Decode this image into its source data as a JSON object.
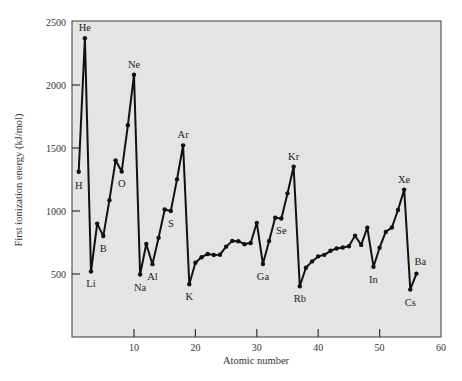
{
  "chart_data": {
    "type": "line",
    "title": "",
    "xlabel": "Atomic number",
    "ylabel": "First ionization energy (kJ/mol)",
    "xlim": [
      0,
      60
    ],
    "ylim": [
      0,
      2500
    ],
    "grid": false,
    "legend": null,
    "x_ticks": [
      10,
      20,
      30,
      40,
      50,
      60
    ],
    "y_ticks": [
      500,
      1000,
      1500,
      2000,
      2500
    ],
    "colors": {
      "plot_background": "#e4e4e4",
      "line": "#111111",
      "frame": "#555555"
    },
    "x": [
      1,
      2,
      3,
      4,
      5,
      6,
      7,
      8,
      9,
      10,
      11,
      12,
      13,
      14,
      15,
      16,
      17,
      18,
      19,
      20,
      21,
      22,
      23,
      24,
      25,
      26,
      27,
      28,
      29,
      30,
      31,
      32,
      33,
      34,
      35,
      36,
      37,
      38,
      39,
      40,
      41,
      42,
      43,
      44,
      45,
      46,
      47,
      48,
      49,
      50,
      51,
      52,
      53,
      54,
      55,
      56
    ],
    "series": [
      {
        "name": "First ionization energy",
        "values": [
          1312,
          2372,
          520,
          900,
          801,
          1086,
          1402,
          1314,
          1681,
          2081,
          496,
          738,
          578,
          787,
          1012,
          1000,
          1251,
          1521,
          419,
          590,
          633,
          659,
          651,
          653,
          717,
          763,
          760,
          737,
          746,
          906,
          579,
          762,
          947,
          941,
          1140,
          1351,
          403,
          550,
          600,
          640,
          652,
          684,
          702,
          710,
          720,
          804,
          731,
          868,
          558,
          709,
          834,
          869,
          1008,
          1170,
          376,
          503
        ]
      }
    ],
    "annotations": [
      {
        "x": 1,
        "label": "H",
        "position": "below"
      },
      {
        "x": 2,
        "label": "He",
        "position": "above"
      },
      {
        "x": 3,
        "label": "Li",
        "position": "below"
      },
      {
        "x": 5,
        "label": "B",
        "position": "below"
      },
      {
        "x": 8,
        "label": "O",
        "position": "below"
      },
      {
        "x": 10,
        "label": "Ne",
        "position": "above"
      },
      {
        "x": 11,
        "label": "Na",
        "position": "below"
      },
      {
        "x": 13,
        "label": "Al",
        "position": "below"
      },
      {
        "x": 16,
        "label": "S",
        "position": "below"
      },
      {
        "x": 18,
        "label": "Ar",
        "position": "above"
      },
      {
        "x": 19,
        "label": "K",
        "position": "below"
      },
      {
        "x": 31,
        "label": "Ga",
        "position": "below"
      },
      {
        "x": 34,
        "label": "Se",
        "position": "below"
      },
      {
        "x": 36,
        "label": "Kr",
        "position": "above"
      },
      {
        "x": 37,
        "label": "Rb",
        "position": "below"
      },
      {
        "x": 49,
        "label": "In",
        "position": "below"
      },
      {
        "x": 54,
        "label": "Xe",
        "position": "above"
      },
      {
        "x": 55,
        "label": "Cs",
        "position": "below"
      },
      {
        "x": 56,
        "label": "Ba",
        "position": "above"
      }
    ]
  },
  "axes": {
    "x_title": "Atomic number",
    "y_title": "First ionization energy (kJ/mol)"
  }
}
